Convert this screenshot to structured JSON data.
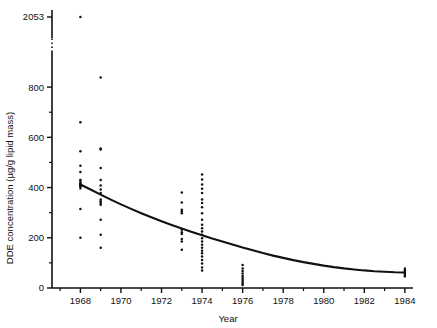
{
  "chart_data": {
    "type": "scatter",
    "title": "",
    "xlabel": "Year",
    "ylabel": "DDE concentration (µg/g lipid mass)",
    "xlim": [
      1966.6,
      1984.4
    ],
    "ylim": [
      0,
      900
    ],
    "grid": false,
    "legend": "none",
    "axis_break": {
      "present": true,
      "below": 900,
      "above": 2053,
      "note": "y-axis is broken between the 800 region and the single 2053 value"
    },
    "xticks": [
      1968,
      1970,
      1972,
      1974,
      1976,
      1978,
      1980,
      1982,
      1984
    ],
    "xtick_labels": [
      "1968",
      "1970",
      "1972",
      "1974",
      "1976",
      "1978",
      "1980",
      "1982",
      "1984"
    ],
    "xminor": [
      1967,
      1969,
      1971,
      1973,
      1975,
      1977,
      1979,
      1981,
      1983
    ],
    "yticks": [
      0,
      200,
      400,
      600,
      800,
      2053
    ],
    "ytick_labels": [
      "0",
      "200",
      "400",
      "600",
      "800",
      "2053"
    ],
    "yminor": [
      100,
      300,
      500,
      700
    ],
    "series": [
      {
        "name": "DDE observations",
        "marker": "dot",
        "color": "#111111",
        "points": [
          [
            1968,
            2053
          ],
          [
            1968,
            660
          ],
          [
            1968,
            545
          ],
          [
            1968,
            487
          ],
          [
            1968,
            462
          ],
          [
            1968,
            430
          ],
          [
            1968,
            418
          ],
          [
            1968,
            412
          ],
          [
            1968,
            408
          ],
          [
            1968,
            405
          ],
          [
            1968,
            315
          ],
          [
            1968,
            200
          ],
          [
            1969,
            838
          ],
          [
            1969,
            556
          ],
          [
            1969,
            552
          ],
          [
            1969,
            478
          ],
          [
            1969,
            430
          ],
          [
            1969,
            408
          ],
          [
            1969,
            392
          ],
          [
            1969,
            378
          ],
          [
            1969,
            352
          ],
          [
            1969,
            345
          ],
          [
            1969,
            338
          ],
          [
            1969,
            332
          ],
          [
            1969,
            272
          ],
          [
            1969,
            212
          ],
          [
            1969,
            160
          ],
          [
            1973,
            380
          ],
          [
            1973,
            340
          ],
          [
            1973,
            312
          ],
          [
            1973,
            305
          ],
          [
            1973,
            298
          ],
          [
            1973,
            232
          ],
          [
            1973,
            222
          ],
          [
            1973,
            215
          ],
          [
            1973,
            195
          ],
          [
            1973,
            185
          ],
          [
            1973,
            152
          ],
          [
            1974,
            452
          ],
          [
            1974,
            432
          ],
          [
            1974,
            412
          ],
          [
            1974,
            395
          ],
          [
            1974,
            378
          ],
          [
            1974,
            352
          ],
          [
            1974,
            338
          ],
          [
            1974,
            322
          ],
          [
            1974,
            298
          ],
          [
            1974,
            272
          ],
          [
            1974,
            252
          ],
          [
            1974,
            238
          ],
          [
            1974,
            225
          ],
          [
            1974,
            212
          ],
          [
            1974,
            198
          ],
          [
            1974,
            185
          ],
          [
            1974,
            172
          ],
          [
            1974,
            160
          ],
          [
            1974,
            148
          ],
          [
            1974,
            138
          ],
          [
            1974,
            125
          ],
          [
            1974,
            112
          ],
          [
            1974,
            98
          ],
          [
            1974,
            82
          ],
          [
            1974,
            70
          ],
          [
            1976,
            92
          ],
          [
            1976,
            78
          ],
          [
            1976,
            68
          ],
          [
            1976,
            58
          ],
          [
            1976,
            48
          ],
          [
            1976,
            40
          ],
          [
            1976,
            32
          ],
          [
            1976,
            25
          ],
          [
            1976,
            18
          ],
          [
            1976,
            12
          ],
          [
            1984,
            70
          ],
          [
            1984,
            58
          ],
          [
            1984,
            48
          ]
        ]
      }
    ],
    "fit_curve": {
      "name": "fitted exponential decline",
      "color": "#111111",
      "points": [
        [
          1968.0,
          412
        ],
        [
          1968.5,
          392
        ],
        [
          1969.0,
          372
        ],
        [
          1969.5,
          352
        ],
        [
          1970.0,
          333
        ],
        [
          1970.5,
          315
        ],
        [
          1971.0,
          298
        ],
        [
          1971.5,
          282
        ],
        [
          1972.0,
          266
        ],
        [
          1972.5,
          251
        ],
        [
          1973.0,
          237
        ],
        [
          1973.5,
          223
        ],
        [
          1974.0,
          210
        ],
        [
          1974.5,
          197
        ],
        [
          1975.0,
          185
        ],
        [
          1975.5,
          173
        ],
        [
          1976.0,
          161
        ],
        [
          1976.5,
          150
        ],
        [
          1977.0,
          139
        ],
        [
          1977.5,
          129
        ],
        [
          1978.0,
          120
        ],
        [
          1978.5,
          111
        ],
        [
          1979.0,
          103
        ],
        [
          1979.5,
          96
        ],
        [
          1980.0,
          89
        ],
        [
          1980.5,
          83
        ],
        [
          1981.0,
          78
        ],
        [
          1981.5,
          74
        ],
        [
          1982.0,
          70
        ],
        [
          1982.5,
          67
        ],
        [
          1983.0,
          65
        ],
        [
          1983.5,
          63
        ],
        [
          1984.0,
          62
        ]
      ]
    }
  }
}
